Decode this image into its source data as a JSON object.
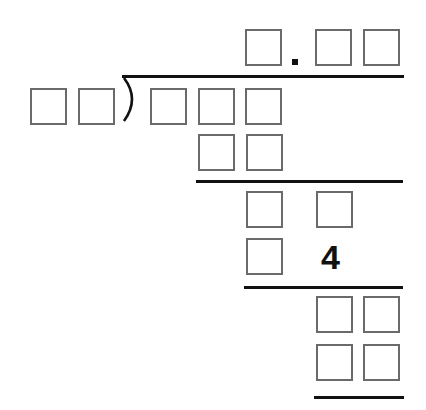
{
  "worksheet": {
    "type": "long-division",
    "quotient": {
      "boxes_before_decimal": 1,
      "decimal_point": ".",
      "boxes_after_decimal": 2
    },
    "divisor": {
      "boxes": 2
    },
    "dividend": {
      "boxes": 3
    },
    "work_rows": [
      {
        "row": 1,
        "boxes": 2,
        "given": []
      },
      {
        "row": 2,
        "boxes": 2,
        "given": []
      },
      {
        "row": 3,
        "boxes": 1,
        "given": [
          "4"
        ]
      },
      {
        "row": 4,
        "boxes": 2,
        "given": []
      },
      {
        "row": 5,
        "boxes": 2,
        "given": []
      }
    ],
    "given_digit": "4",
    "colors": {
      "box_border": "#6a6a6a",
      "line": "#111111",
      "background": "#ffffff"
    }
  }
}
